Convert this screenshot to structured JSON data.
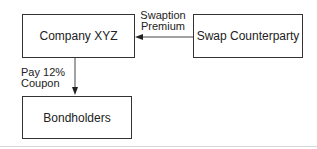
{
  "diagram": {
    "nodes": {
      "company": {
        "label": "Company XYZ"
      },
      "counterparty": {
        "label": "Swap Counterparty"
      },
      "bondholders": {
        "label": "Bondholders"
      }
    },
    "edges": {
      "premium": {
        "from": "Swap Counterparty",
        "to": "Company XYZ",
        "label_line1": "Swaption",
        "label_line2": "Premium"
      },
      "coupon": {
        "from": "Company XYZ",
        "to": "Bondholders",
        "label_line1": "Pay 12%",
        "label_line2": "Coupon"
      }
    },
    "colors": {
      "stroke": "#333333",
      "text": "#222222",
      "background": "#ffffff"
    }
  }
}
